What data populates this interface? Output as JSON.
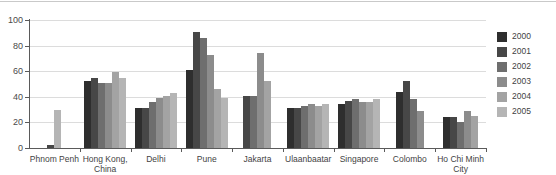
{
  "chart_data": {
    "type": "bar",
    "title": "",
    "xlabel": "",
    "ylabel": "",
    "ylim": [
      0,
      100
    ],
    "yticks": [
      0,
      20,
      40,
      60,
      80,
      100
    ],
    "grid": true,
    "legend_position": "right",
    "categories": [
      "Phnom Penh",
      "Hong Kong,\nChina",
      "Delhi",
      "Pune",
      "Jakarta",
      "Ulaanbaatar",
      "Singapore",
      "Colombo",
      "Ho Chi Minh City"
    ],
    "series": [
      {
        "name": "2000",
        "color": "#2e2e2e",
        "values": [
          null,
          52,
          31,
          61,
          null,
          31,
          34,
          44,
          24
        ]
      },
      {
        "name": "2001",
        "color": "#474747",
        "values": [
          2.5,
          55,
          31,
          91,
          41,
          31,
          37,
          52,
          24
        ]
      },
      {
        "name": "2002",
        "color": "#6e6e6e",
        "values": [
          null,
          51,
          36,
          86,
          41,
          33,
          38,
          38,
          20
        ]
      },
      {
        "name": "2003",
        "color": "#8c8c8c",
        "values": [
          null,
          51,
          39,
          73,
          74,
          34,
          36,
          29,
          29
        ]
      },
      {
        "name": "2004",
        "color": "#a3a3a3",
        "values": [
          null,
          59,
          41,
          46,
          52,
          33,
          36,
          null,
          25
        ]
      },
      {
        "name": "2005",
        "color": "#b5b5b5",
        "values": [
          30,
          55,
          43,
          39,
          null,
          34,
          38,
          null,
          null
        ]
      }
    ]
  },
  "legend": {
    "items": [
      {
        "label": "2000",
        "color": "#2e2e2e"
      },
      {
        "label": "2001",
        "color": "#474747"
      },
      {
        "label": "2002",
        "color": "#6e6e6e"
      },
      {
        "label": "2003",
        "color": "#8c8c8c"
      },
      {
        "label": "2004",
        "color": "#a3a3a3"
      },
      {
        "label": "2005",
        "color": "#b5b5b5"
      }
    ]
  },
  "axis": {
    "y_tick_labels": [
      "0",
      "20",
      "40",
      "60",
      "80",
      "100"
    ]
  }
}
